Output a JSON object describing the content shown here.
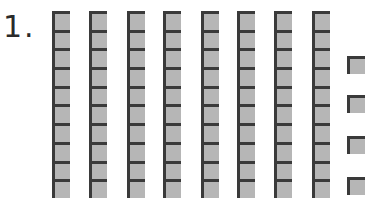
{
  "problem": {
    "label": "1.",
    "tens_rods": 8,
    "ones_units": 4,
    "cells_per_rod": 10
  },
  "layout": {
    "rod_lefts": [
      52,
      89,
      127,
      163,
      201,
      237,
      274,
      312
    ],
    "unit_left": 347,
    "unit_tops": [
      56,
      95,
      136,
      177
    ]
  },
  "colors": {
    "block_fill": "#b6b6b6",
    "block_edge": "#3a3a3a",
    "label": "#2a2a2a"
  }
}
